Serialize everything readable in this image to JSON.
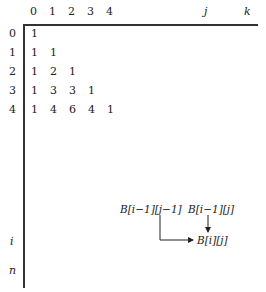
{
  "column_headers": [
    "0",
    "1",
    "2",
    "3",
    "4",
    "j",
    "k"
  ],
  "row_headers": [
    "0",
    "1",
    "2",
    "3",
    "4",
    "i",
    "n"
  ],
  "rows": [
    [
      "1"
    ],
    [
      "1",
      "1"
    ],
    [
      "1",
      "2",
      "1"
    ],
    [
      "1",
      "3",
      "3",
      "1"
    ],
    [
      "1",
      "4",
      "6",
      "4",
      "1"
    ]
  ],
  "recurrence": {
    "term_diag": "B[i−1][j−1]",
    "term_up": "B[i−1][j]",
    "result": "B[i][j]"
  }
}
